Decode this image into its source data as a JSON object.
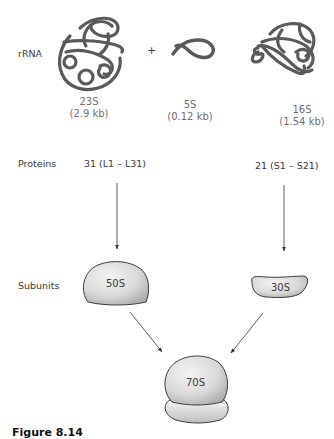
{
  "diagram": {
    "type": "flow",
    "rows": {
      "rrna_label": "rRNA",
      "proteins_label": "Proteins",
      "subunits_label": "Subunits"
    },
    "rrna": [
      {
        "name": "23S",
        "size": "(2.9 kb)"
      },
      {
        "name": "5S",
        "size": "(0.12 kb)"
      },
      {
        "name": "16S",
        "size": "(1.54 kb)"
      }
    ],
    "plus_sign": "+",
    "proteins": {
      "large": "31 (L1 – L31)",
      "small": "21 (S1 – S21)"
    },
    "subunits": {
      "large": "50S",
      "small": "30S"
    },
    "ribosome": "70S",
    "colors": {
      "rna_strand": "#5a5a5a",
      "subunit_fill_light": "#f2f2f2",
      "subunit_fill_dark": "#b5b5b5",
      "outline": "#3c3c3c",
      "arrow": "#333333"
    },
    "edges": [
      {
        "from": "23S+5S rRNA & 31 proteins",
        "to": "50S"
      },
      {
        "from": "16S rRNA & 21 proteins",
        "to": "30S"
      },
      {
        "from": "50S",
        "to": "70S"
      },
      {
        "from": "30S",
        "to": "70S"
      }
    ]
  },
  "caption": "Figure 8.14"
}
